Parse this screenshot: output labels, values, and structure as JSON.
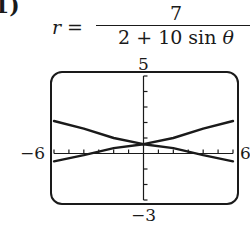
{
  "part_label": "1)",
  "equation": {
    "lhs": "r =",
    "numerator": "7",
    "denominator_prefix": "2 + 10 sin ",
    "denominator_var": "θ"
  },
  "window": {
    "ymax_label": "5",
    "ymin_label": "−3",
    "xmin_label": "−6",
    "xmax_label": "6"
  },
  "chart_data": {
    "type": "line",
    "xlabel": "",
    "ylabel": "",
    "xlim": [
      -6,
      6
    ],
    "ylim": [
      -3,
      5
    ],
    "x_ticks_step": 1,
    "y_ticks_step": 1,
    "grid": false,
    "series": [
      {
        "name": "upper branch",
        "x": [
          -6,
          -4,
          -2,
          0,
          2,
          4,
          6
        ],
        "y": [
          2.1,
          1.6,
          1.0,
          0.6,
          1.0,
          1.6,
          2.1
        ]
      },
      {
        "name": "lower branch",
        "x": [
          -6,
          -4,
          -2,
          0,
          2,
          4,
          6
        ],
        "y": [
          -0.5,
          -0.1,
          0.35,
          0.6,
          0.35,
          -0.1,
          -0.5
        ]
      }
    ]
  }
}
